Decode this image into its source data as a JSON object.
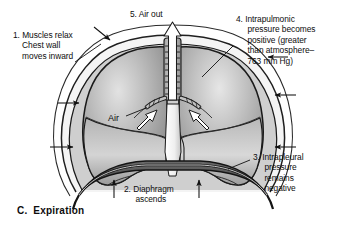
{
  "figure": {
    "caption_letter": "C.",
    "caption_text": "Expiration",
    "caption": "C.  Expiration",
    "background_color": "#ffffff",
    "ink_color": "#111111"
  },
  "labels": {
    "muscles_relax": "1. Muscles relax\n    Chest wall\n    moves inward",
    "diaphragm_ascends": "2. Diaphragm\n     ascends",
    "intrapleural": "3. Intrapleural\n     pressure\n     remains\n     negative",
    "intrapulmonic": "4. Intrapulmonic\n     pressure becomes\n     positive (greater\n     than atmosphere–\n     763 mm Hg)",
    "air_out": "5. Air out",
    "air": "Air"
  },
  "diagram": {
    "name": "expiration-lung-diagram",
    "parts": [
      "chest-wall",
      "pleural-membrane",
      "left-lung",
      "right-lung",
      "trachea",
      "bronchi",
      "diaphragm",
      "air-out-arrow",
      "air-in-arrows",
      "chest-wall-inward-arrows",
      "diaphragm-ascends-arrows"
    ],
    "colors": {
      "lung_light": "#d9d9d9",
      "lung_mid": "#a8a8a8",
      "lung_dark": "#6f6f6f",
      "outline": "#1c1c1c",
      "pleura": "#f2f2f2",
      "diaphragm": "#5a5a5a",
      "trachea": "#c9c9c9",
      "arrow_fill": "#ffffff"
    }
  }
}
